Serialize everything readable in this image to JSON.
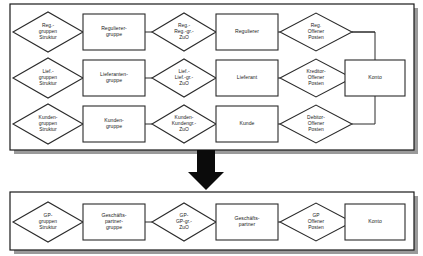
{
  "diagram": {
    "title": "",
    "type": "entity-relationship-diagram",
    "colors": {
      "background": "#ffffff",
      "stroke": "#2b2b2b",
      "panel_border": "#1a1a1a",
      "shadow": "#9a9a9a",
      "arrow": "#0b0b0b",
      "text": "#1a1a1a"
    },
    "panels": [
      {
        "id": "panel-before",
        "name": "top-panel",
        "nodes": [
          {
            "id": "reg-gruppen-struktur",
            "shape": "diamond",
            "lines": [
              "Reg.-",
              "gruppen",
              "Struktur"
            ]
          },
          {
            "id": "regulierer-gruppe",
            "shape": "rect",
            "lines": [
              "Regulierer-",
              "gruppe"
            ]
          },
          {
            "id": "reg-reg-gr-zuo",
            "shape": "diamond",
            "lines": [
              "Reg.-",
              "Reg.-gr.-",
              "ZuO"
            ]
          },
          {
            "id": "regulierer",
            "shape": "rect",
            "lines": [
              "Regulierer"
            ]
          },
          {
            "id": "reg-offener-posten",
            "shape": "diamond",
            "lines": [
              "Reg.",
              "Offener",
              "Posten"
            ]
          },
          {
            "id": "lief-gruppen-struktur",
            "shape": "diamond",
            "lines": [
              "Lief.-",
              "gruppen",
              "Struktur"
            ]
          },
          {
            "id": "lieferanten-gruppe",
            "shape": "rect",
            "lines": [
              "Lieferanten-",
              "gruppe"
            ]
          },
          {
            "id": "lief-lief-gr-zuo",
            "shape": "diamond",
            "lines": [
              "Lief.-",
              "Lief.-gr.-",
              "ZuO"
            ]
          },
          {
            "id": "lieferant",
            "shape": "rect",
            "lines": [
              "Lieferant"
            ]
          },
          {
            "id": "kreditor-offener-posten",
            "shape": "diamond",
            "lines": [
              "Kreditor-",
              "Offener",
              "Posten"
            ]
          },
          {
            "id": "kunden-gruppen-struktur",
            "shape": "diamond",
            "lines": [
              "Kunden-",
              "gruppen",
              "Struktur"
            ]
          },
          {
            "id": "kunden-gruppe",
            "shape": "rect",
            "lines": [
              "Kunden-",
              "gruppe"
            ]
          },
          {
            "id": "kunden-kundengr-zuo",
            "shape": "diamond",
            "lines": [
              "Kunden-",
              "Kundengr.-",
              "ZuO"
            ]
          },
          {
            "id": "kunde",
            "shape": "rect",
            "lines": [
              "Kunde"
            ]
          },
          {
            "id": "debitor-offener-posten",
            "shape": "diamond",
            "lines": [
              "Debitor-",
              "Offener",
              "Posten"
            ]
          },
          {
            "id": "konto-top",
            "shape": "rect",
            "lines": [
              "Konto"
            ]
          }
        ]
      },
      {
        "id": "panel-after",
        "name": "bottom-panel",
        "nodes": [
          {
            "id": "gp-gruppen-struktur",
            "shape": "diamond",
            "lines": [
              "GP-",
              "gruppen",
              "Struktur"
            ]
          },
          {
            "id": "geschaeftspartner-gruppe",
            "shape": "rect",
            "lines": [
              "Geschäfts-",
              "partner-",
              "gruppe"
            ]
          },
          {
            "id": "gp-gp-gr-zuo",
            "shape": "diamond",
            "lines": [
              "GP-",
              "GP-gr.-",
              "ZuO"
            ]
          },
          {
            "id": "geschaeftspartner",
            "shape": "rect",
            "lines": [
              "Geschäfts-",
              "partner"
            ]
          },
          {
            "id": "gp-offener-posten",
            "shape": "diamond",
            "lines": [
              "GP",
              "Offener",
              "Posten"
            ]
          },
          {
            "id": "konto-bottom",
            "shape": "rect",
            "lines": [
              "Konto"
            ]
          }
        ]
      }
    ],
    "transition_arrow": {
      "name": "down-arrow",
      "direction": "down"
    }
  }
}
